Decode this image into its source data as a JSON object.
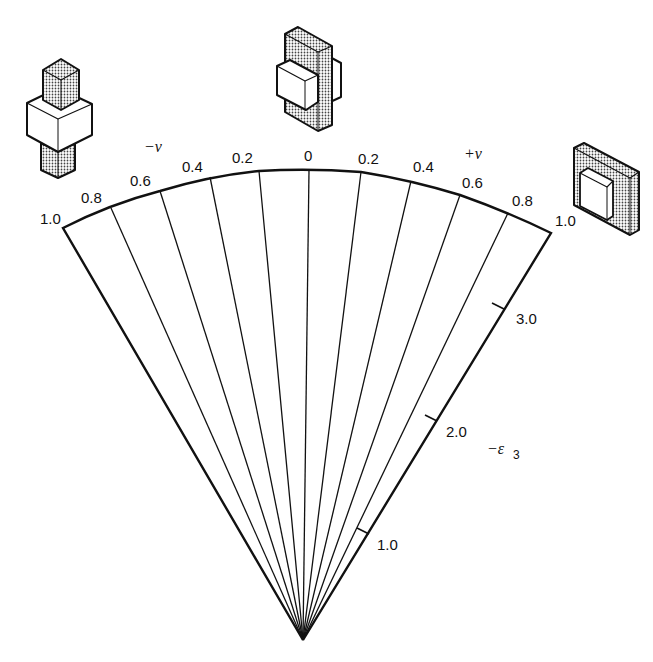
{
  "diagram": {
    "type": "fan-diagram",
    "apex": [
      303,
      640
    ],
    "colors": {
      "ink": "#111111",
      "background": "#ffffff",
      "stipple": "#555555"
    },
    "v_axis": {
      "negative_label": "−v",
      "positive_label": "+v",
      "left_ticks": [
        "1.0",
        "0.8",
        "0.6",
        "0.4",
        "0.2"
      ],
      "center_tick": "0",
      "right_ticks": [
        "0.2",
        "0.4",
        "0.6",
        "0.8",
        "1.0"
      ]
    },
    "strain_axis": {
      "label": "−ε",
      "subscript": "3",
      "ticks": [
        "1.0",
        "2.0",
        "3.0"
      ]
    },
    "icons": [
      {
        "name": "block-compressed-vertical-icon",
        "position": "top-left"
      },
      {
        "name": "block-sheared-center-icon",
        "position": "top-center"
      },
      {
        "name": "block-compressed-plate-icon",
        "position": "top-right"
      }
    ]
  }
}
